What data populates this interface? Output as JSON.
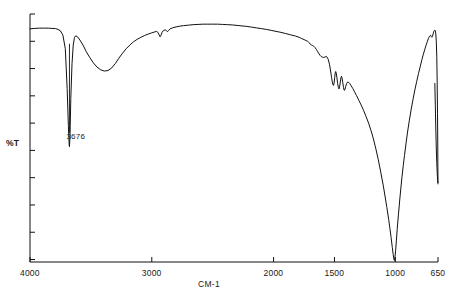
{
  "chart_data": {
    "type": "line",
    "title": "",
    "subtitle": "",
    "xlabel": "CM-1",
    "ylabel": "%T",
    "xlim": [
      4000,
      650
    ],
    "ylim": [
      0,
      100
    ],
    "x_reversed": true,
    "grid": false,
    "legend": null,
    "legend_position": "none",
    "x_ticks": [
      {
        "value": 4000,
        "label": "4000"
      },
      {
        "value": 3000,
        "label": "3000"
      },
      {
        "value": 2000,
        "label": "2000"
      },
      {
        "value": 1500,
        "label": "1500"
      },
      {
        "value": 1000,
        "label": "1000"
      },
      {
        "value": 650,
        "label": "650"
      }
    ],
    "y_ticks": [
      {
        "value": 100,
        "label": ""
      },
      {
        "value": 89,
        "label": ""
      },
      {
        "value": 78,
        "label": ""
      },
      {
        "value": 67,
        "label": ""
      },
      {
        "value": 56,
        "label": ""
      },
      {
        "value": 45,
        "label": ""
      },
      {
        "value": 34,
        "label": ""
      },
      {
        "value": 23,
        "label": ""
      },
      {
        "value": 12,
        "label": ""
      },
      {
        "value": 1,
        "label": ""
      }
    ],
    "annotations": [
      {
        "name": "peak-3676",
        "label": "3676",
        "x": 3676,
        "y": 50,
        "leader_from_y": 88,
        "leader_to_y": 52
      }
    ],
    "series": [
      {
        "name": "transmittance",
        "color": "#111111",
        "points": [
          [
            4000,
            94.0
          ],
          [
            3960,
            94.2
          ],
          [
            3920,
            94.3
          ],
          [
            3880,
            94.3
          ],
          [
            3850,
            94.3
          ],
          [
            3820,
            94.2
          ],
          [
            3790,
            94.1
          ],
          [
            3770,
            93.8
          ],
          [
            3750,
            93.2
          ],
          [
            3730,
            91.5
          ],
          [
            3710,
            86.0
          ],
          [
            3695,
            70.0
          ],
          [
            3685,
            55.0
          ],
          [
            3678,
            47.0
          ],
          [
            3676,
            46.5
          ],
          [
            3672,
            50.0
          ],
          [
            3665,
            66.0
          ],
          [
            3655,
            80.0
          ],
          [
            3645,
            87.5
          ],
          [
            3635,
            90.5
          ],
          [
            3625,
            91.2
          ],
          [
            3610,
            90.8
          ],
          [
            3590,
            89.5
          ],
          [
            3565,
            87.5
          ],
          [
            3540,
            85.0
          ],
          [
            3510,
            82.5
          ],
          [
            3480,
            80.3
          ],
          [
            3450,
            78.6
          ],
          [
            3420,
            77.5
          ],
          [
            3390,
            77.0
          ],
          [
            3360,
            77.2
          ],
          [
            3330,
            78.2
          ],
          [
            3300,
            80.0
          ],
          [
            3270,
            82.2
          ],
          [
            3240,
            84.2
          ],
          [
            3210,
            86.0
          ],
          [
            3180,
            87.5
          ],
          [
            3150,
            88.8
          ],
          [
            3120,
            89.8
          ],
          [
            3090,
            90.6
          ],
          [
            3060,
            91.3
          ],
          [
            3030,
            91.9
          ],
          [
            3000,
            92.4
          ],
          [
            2975,
            92.8
          ],
          [
            2960,
            93.0
          ],
          [
            2950,
            92.6
          ],
          [
            2940,
            91.6
          ],
          [
            2932,
            90.8
          ],
          [
            2925,
            91.4
          ],
          [
            2915,
            92.6
          ],
          [
            2905,
            93.3
          ],
          [
            2890,
            93.6
          ],
          [
            2878,
            93.2
          ],
          [
            2870,
            92.9
          ],
          [
            2862,
            93.4
          ],
          [
            2850,
            94.0
          ],
          [
            2830,
            94.4
          ],
          [
            2800,
            94.8
          ],
          [
            2770,
            95.1
          ],
          [
            2740,
            95.3
          ],
          [
            2700,
            95.5
          ],
          [
            2660,
            95.7
          ],
          [
            2620,
            95.8
          ],
          [
            2580,
            95.9
          ],
          [
            2540,
            95.9
          ],
          [
            2500,
            95.9
          ],
          [
            2460,
            95.9
          ],
          [
            2420,
            95.8
          ],
          [
            2380,
            95.7
          ],
          [
            2340,
            95.6
          ],
          [
            2300,
            95.4
          ],
          [
            2260,
            95.2
          ],
          [
            2220,
            95.0
          ],
          [
            2180,
            94.7
          ],
          [
            2140,
            94.4
          ],
          [
            2100,
            94.1
          ],
          [
            2060,
            93.8
          ],
          [
            2020,
            93.4
          ],
          [
            1980,
            93.0
          ],
          [
            1940,
            92.6
          ],
          [
            1900,
            92.1
          ],
          [
            1860,
            91.6
          ],
          [
            1820,
            91.1
          ],
          [
            1790,
            90.6
          ],
          [
            1770,
            90.1
          ],
          [
            1750,
            89.7
          ],
          [
            1735,
            89.3
          ],
          [
            1720,
            89.0
          ],
          [
            1710,
            88.5
          ],
          [
            1700,
            87.9
          ],
          [
            1690,
            87.5
          ],
          [
            1680,
            87.3
          ],
          [
            1670,
            87.0
          ],
          [
            1660,
            86.5
          ],
          [
            1650,
            85.8
          ],
          [
            1640,
            85.0
          ],
          [
            1630,
            84.2
          ],
          [
            1620,
            83.4
          ],
          [
            1610,
            82.9
          ],
          [
            1600,
            82.6
          ],
          [
            1590,
            82.5
          ],
          [
            1578,
            82.6
          ],
          [
            1568,
            82.9
          ],
          [
            1560,
            82.6
          ],
          [
            1550,
            81.5
          ],
          [
            1540,
            79.5
          ],
          [
            1532,
            77.0
          ],
          [
            1524,
            74.5
          ],
          [
            1518,
            72.6
          ],
          [
            1512,
            71.5
          ],
          [
            1508,
            71.2
          ],
          [
            1503,
            72.2
          ],
          [
            1498,
            74.5
          ],
          [
            1494,
            76.2
          ],
          [
            1490,
            76.8
          ],
          [
            1486,
            76.3
          ],
          [
            1480,
            74.3
          ],
          [
            1474,
            72.0
          ],
          [
            1468,
            70.4
          ],
          [
            1463,
            69.8
          ],
          [
            1458,
            70.6
          ],
          [
            1452,
            72.6
          ],
          [
            1447,
            74.3
          ],
          [
            1443,
            74.9
          ],
          [
            1438,
            74.3
          ],
          [
            1432,
            72.4
          ],
          [
            1426,
            70.3
          ],
          [
            1420,
            69.2
          ],
          [
            1415,
            69.4
          ],
          [
            1408,
            70.8
          ],
          [
            1400,
            72.0
          ],
          [
            1392,
            72.6
          ],
          [
            1385,
            72.5
          ],
          [
            1375,
            72.0
          ],
          [
            1365,
            71.2
          ],
          [
            1350,
            70.0
          ],
          [
            1335,
            68.6
          ],
          [
            1320,
            67.2
          ],
          [
            1300,
            65.2
          ],
          [
            1280,
            63.2
          ],
          [
            1260,
            61.0
          ],
          [
            1240,
            58.6
          ],
          [
            1220,
            56.0
          ],
          [
            1200,
            53.0
          ],
          [
            1180,
            49.6
          ],
          [
            1160,
            45.6
          ],
          [
            1140,
            41.2
          ],
          [
            1120,
            36.2
          ],
          [
            1100,
            31.0
          ],
          [
            1085,
            26.6
          ],
          [
            1070,
            22.0
          ],
          [
            1055,
            17.2
          ],
          [
            1045,
            13.6
          ],
          [
            1035,
            9.8
          ],
          [
            1025,
            5.8
          ],
          [
            1018,
            3.0
          ],
          [
            1012,
            1.2
          ],
          [
            1008,
            0.6
          ],
          [
            1004,
            1.6
          ],
          [
            998,
            4.5
          ],
          [
            992,
            8.5
          ],
          [
            985,
            13.2
          ],
          [
            975,
            19.0
          ],
          [
            965,
            24.6
          ],
          [
            955,
            29.8
          ],
          [
            945,
            34.6
          ],
          [
            935,
            39.0
          ],
          [
            925,
            43.0
          ],
          [
            912,
            48.0
          ],
          [
            900,
            52.4
          ],
          [
            885,
            57.2
          ],
          [
            870,
            61.6
          ],
          [
            855,
            65.6
          ],
          [
            840,
            69.4
          ],
          [
            825,
            72.8
          ],
          [
            810,
            76.0
          ],
          [
            795,
            79.0
          ],
          [
            782,
            81.6
          ],
          [
            770,
            83.8
          ],
          [
            758,
            85.8
          ],
          [
            748,
            87.4
          ],
          [
            738,
            88.8
          ],
          [
            730,
            90.0
          ],
          [
            722,
            90.8
          ],
          [
            715,
            91.3
          ],
          [
            710,
            91.4
          ],
          [
            705,
            90.9
          ],
          [
            700,
            90.6
          ],
          [
            696,
            90.9
          ],
          [
            692,
            91.6
          ],
          [
            688,
            92.4
          ],
          [
            684,
            93.0
          ],
          [
            680,
            93.4
          ],
          [
            676,
            93.5
          ],
          [
            672,
            93.2
          ],
          [
            668,
            92.0
          ],
          [
            664,
            89.0
          ],
          [
            660,
            83.0
          ],
          [
            657,
            73.0
          ],
          [
            654,
            60.0
          ],
          [
            652,
            48.0
          ],
          [
            651,
            38.0
          ],
          [
            650,
            32.0
          ]
        ]
      },
      {
        "name": "terminal-spike",
        "color": "#111111",
        "points": [
          [
            676,
            72.0
          ],
          [
            672,
            63.0
          ],
          [
            668,
            54.0
          ],
          [
            664,
            46.0
          ],
          [
            660,
            40.0
          ],
          [
            656,
            35.5
          ],
          [
            653,
            33.0
          ],
          [
            651,
            31.8
          ],
          [
            650,
            31.5
          ]
        ]
      }
    ],
    "notable_peaks": [
      {
        "wavenumber": 3676,
        "labeled": true,
        "description": "sharp narrow O-H stretch"
      },
      {
        "wavenumber": 3390,
        "labeled": false,
        "description": "broad O-H band"
      },
      {
        "wavenumber": 2932,
        "labeled": false,
        "description": "C-H stretch notch"
      },
      {
        "wavenumber": 2878,
        "labeled": false,
        "description": "C-H stretch notch"
      },
      {
        "wavenumber": 1510,
        "labeled": false,
        "description": "sharp band"
      },
      {
        "wavenumber": 1463,
        "labeled": false,
        "description": "sharp band"
      },
      {
        "wavenumber": 1420,
        "labeled": false,
        "description": "sharp band"
      },
      {
        "wavenumber": 1010,
        "labeled": false,
        "description": "very strong Si-O / C-O absorption"
      },
      {
        "wavenumber": 655,
        "labeled": false,
        "description": "narrow terminal spike"
      }
    ]
  }
}
